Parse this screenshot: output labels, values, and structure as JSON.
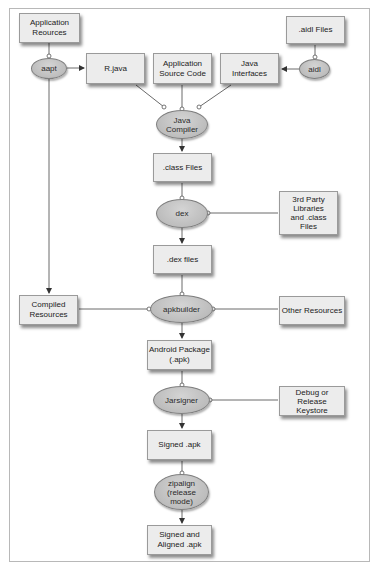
{
  "diagram": {
    "nodes": {
      "app_resources": "Application\nReources",
      "aapt": "aapt",
      "r_java": "R.java",
      "app_source": "Application\nSource Code",
      "java_interfaces": "Java\nInterfaces",
      "aidl_files": ".aidl Files",
      "aidl": "aidl",
      "java_compiler": "Java\nCompiler",
      "class_files": ".class Files",
      "dex": "dex",
      "third_party": "3rd Party\nLibraries\nand .class\nFiles",
      "dex_files": ".dex files",
      "compiled_resources": "Compiled\nResources",
      "apkbuilder": "apkbuilder",
      "other_resources": "Other Resources",
      "android_package": "Android Package\n(.apk)",
      "jarsigner": "Jarsigner",
      "keystore": "Debug or\nRelease\nKeystore",
      "signed_apk": "Signed .apk",
      "zipalign": "zipalign\n(release\nmode)",
      "signed_aligned": "Signed and\nAligned .apk"
    },
    "edges": [
      {
        "from": "app_resources",
        "to": "aapt",
        "type": "input"
      },
      {
        "from": "aapt",
        "to": "r_java",
        "type": "output"
      },
      {
        "from": "aapt",
        "to": "compiled_resources",
        "type": "output"
      },
      {
        "from": "aidl_files",
        "to": "aidl",
        "type": "input"
      },
      {
        "from": "aidl",
        "to": "java_interfaces",
        "type": "output"
      },
      {
        "from": "r_java",
        "to": "java_compiler",
        "type": "input"
      },
      {
        "from": "app_source",
        "to": "java_compiler",
        "type": "input"
      },
      {
        "from": "java_interfaces",
        "to": "java_compiler",
        "type": "input"
      },
      {
        "from": "java_compiler",
        "to": "class_files",
        "type": "output"
      },
      {
        "from": "class_files",
        "to": "dex",
        "type": "input"
      },
      {
        "from": "third_party",
        "to": "dex",
        "type": "input"
      },
      {
        "from": "dex",
        "to": "dex_files",
        "type": "output"
      },
      {
        "from": "dex_files",
        "to": "apkbuilder",
        "type": "input"
      },
      {
        "from": "compiled_resources",
        "to": "apkbuilder",
        "type": "input"
      },
      {
        "from": "other_resources",
        "to": "apkbuilder",
        "type": "input"
      },
      {
        "from": "apkbuilder",
        "to": "android_package",
        "type": "output"
      },
      {
        "from": "android_package",
        "to": "jarsigner",
        "type": "input"
      },
      {
        "from": "keystore",
        "to": "jarsigner",
        "type": "input"
      },
      {
        "from": "jarsigner",
        "to": "signed_apk",
        "type": "output"
      },
      {
        "from": "signed_apk",
        "to": "zipalign",
        "type": "input"
      },
      {
        "from": "zipalign",
        "to": "signed_aligned",
        "type": "output"
      }
    ],
    "colors": {
      "box_fill": "#ececec",
      "tool_fill": "#bdbdbd",
      "line": "#6a6a6a",
      "frame": "#b8b8b8"
    }
  }
}
